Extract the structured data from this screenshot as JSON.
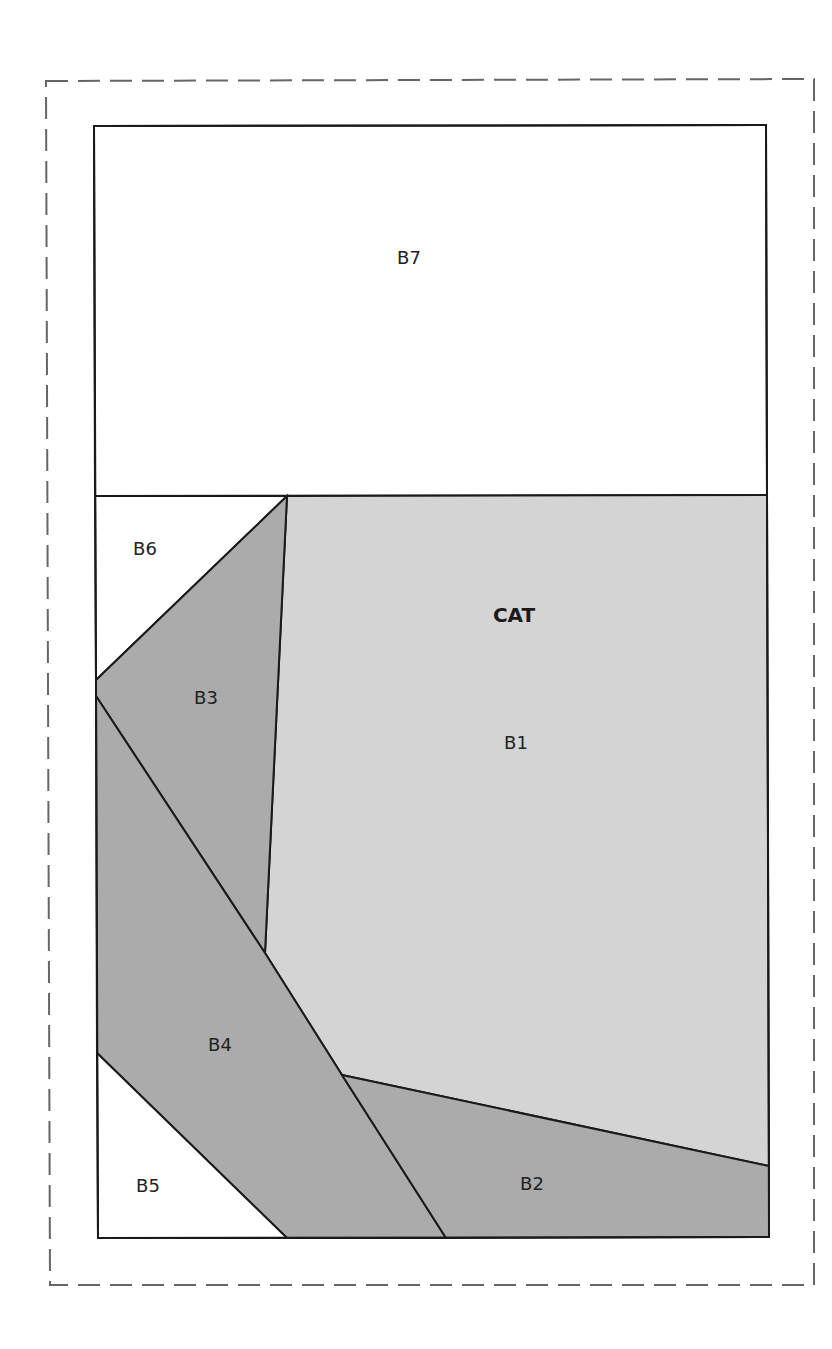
{
  "diagram": {
    "type": "foundation-paper-piecing-pattern",
    "title": "CAT",
    "colors": {
      "background": "#ffffff",
      "light_fabric": "#d3d3d3",
      "dark_fabric": "#a9a9a9",
      "line": "#1a1a1a",
      "seam_allowance": "#666666"
    },
    "pieces": [
      {
        "id": "B1",
        "label": "B1",
        "shade": "light"
      },
      {
        "id": "B2",
        "label": "B2",
        "shade": "dark"
      },
      {
        "id": "B3",
        "label": "B3",
        "shade": "dark"
      },
      {
        "id": "B4",
        "label": "B4",
        "shade": "dark"
      },
      {
        "id": "B5",
        "label": "B5",
        "shade": "white"
      },
      {
        "id": "B6",
        "label": "B6",
        "shade": "white"
      },
      {
        "id": "B7",
        "label": "B7",
        "shade": "white"
      }
    ],
    "section_label": "CAT"
  }
}
